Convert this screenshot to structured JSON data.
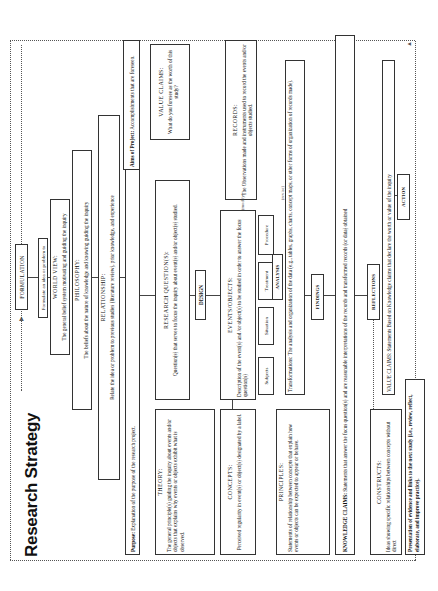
{
  "title": "Research Strategy",
  "formulation": {
    "label": "FORMULATION",
    "subtitle": "Formulate an idea or problem to study"
  },
  "world_view": {
    "heading": "WORLD VIEW:",
    "text": "The general belief system motivating and guiding the inquiry"
  },
  "philosophy": {
    "heading": "PHILOSOPHY:",
    "text": "The beliefs about the nature of knowledge and knowing guiding the inquiry"
  },
  "relationship": {
    "heading": "RELATIONSHIP:",
    "text": "Relate the idea or problem to previous studies (literature review), prior knowledge, and experience"
  },
  "purpose": {
    "label": "Purpose:",
    "text": "Explanation of the purpose of the research project."
  },
  "aims": {
    "label": "Aims of Project:",
    "text": "Accomplishments that are foreseen."
  },
  "theory": {
    "heading": "THEORY:",
    "text": "The general principle(s) guiding the inquiry about events and/or objects that explains why events or objects exhibit what is observed."
  },
  "research_questions": {
    "heading": "RESEARCH QUESTION(S):",
    "text": "Question(s) that serves to focus the inquiry about event(s) and/or object(s) studied."
  },
  "value_claims_top": {
    "heading": "VALUE CLAIMS:",
    "text": "What do you foresee as the worth of this study?"
  },
  "design": {
    "label": "DESIGN"
  },
  "concepts": {
    "heading": "CONCEPTS:",
    "text": "Perceived regularity in event(s) or object(s) designated by a label."
  },
  "events_objects": {
    "heading": "EVENTS/OBJECTS:",
    "text": "Description of the event(s) and /or object(s) to be studied in order to answer the focus question(s)"
  },
  "records": {
    "heading": "RECORDS:",
    "text": "The Observations made and instruments used to record the events and/or objects studied."
  },
  "design_elements": [
    {
      "label": "Subjects"
    },
    {
      "label": "Situation"
    },
    {
      "label": "Treatment"
    },
    {
      "label": "Procedure"
    }
  ],
  "procedure_branches": {
    "modify": "(modify)",
    "revise": "(revise)"
  },
  "analysis": {
    "label": "ANALYSIS"
  },
  "principles": {
    "heading": "PRINCIPLES:",
    "text": "Statements of relationship between concepts that explain how events or objects can be expected to appear or behave."
  },
  "transformations": {
    "label": "Transformations:",
    "text": "The analysis and organization of the data (e.g., tables, graphs, charts, concept maps, or other forms of organization of records made)."
  },
  "findings": {
    "label": "FINDINGS"
  },
  "knowledge_claims": {
    "label": "KNOWLEDGE CLAIMS:",
    "text": "Statements that answer the focus question(s) and are reasonable interpretations of the records and transformed records (or data) obtained"
  },
  "reflections": {
    "label": "REFLECTIONS"
  },
  "constructs": {
    "heading": "CONSTRUCTS:",
    "text": "Ideas showing specific relationships between concepts without direct"
  },
  "value_claims_bottom": {
    "label": "VALUE CLAIMS:",
    "text": "Statements Based on Knowledge claims that declare the worth or value of the inquiry"
  },
  "action": {
    "label": "ACTION"
  },
  "presentation": {
    "text": "Presentation of evidence and links to the next study (i.e., review, reflect, elaborate, and improve practice)."
  }
}
